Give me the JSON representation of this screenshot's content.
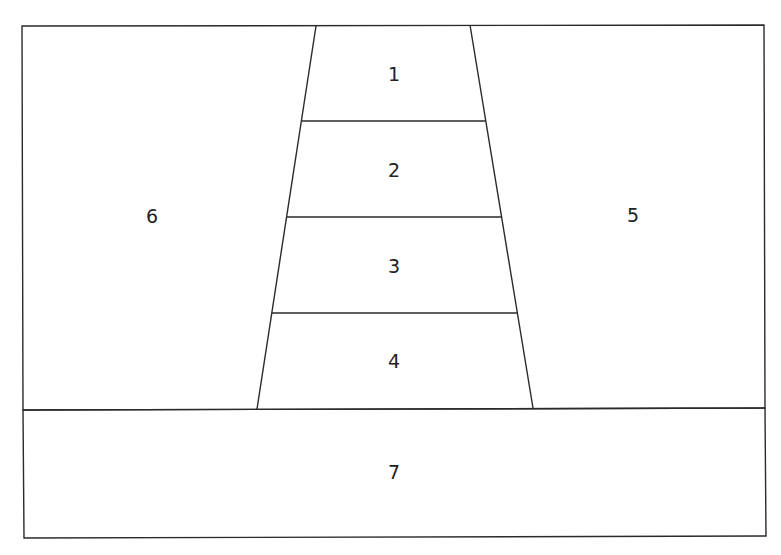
{
  "diagram": {
    "type": "cross-section",
    "regions": [
      {
        "id": "1",
        "label": "1"
      },
      {
        "id": "2",
        "label": "2"
      },
      {
        "id": "3",
        "label": "3"
      },
      {
        "id": "4",
        "label": "4"
      },
      {
        "id": "5",
        "label": "5"
      },
      {
        "id": "6",
        "label": "6"
      },
      {
        "id": "7",
        "label": "7"
      }
    ]
  }
}
